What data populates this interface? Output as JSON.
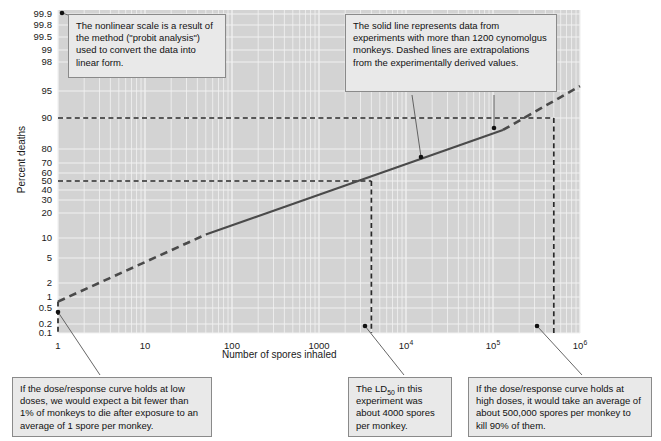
{
  "chart_data": {
    "type": "line",
    "title": "",
    "xlabel": "Number of spores inhaled",
    "ylabel": "Percent deaths",
    "x_scale": "log10",
    "y_scale": "probit",
    "xlim": [
      1,
      1000000
    ],
    "ylim": [
      0.1,
      99.9
    ],
    "grid": true,
    "legend": "none",
    "x_ticks": [
      {
        "value": 1,
        "label": "1",
        "sup": ""
      },
      {
        "value": 10,
        "label": "10",
        "sup": ""
      },
      {
        "value": 100,
        "label": "100",
        "sup": ""
      },
      {
        "value": 1000,
        "label": "1000",
        "sup": ""
      },
      {
        "value": 10000,
        "label": "10",
        "sup": "4"
      },
      {
        "value": 100000,
        "label": "10",
        "sup": "5"
      },
      {
        "value": 1000000,
        "label": "10",
        "sup": "6"
      }
    ],
    "y_ticks": [
      99.9,
      99.8,
      99.5,
      99,
      98,
      95,
      90,
      80,
      70,
      60,
      50,
      40,
      30,
      20,
      10,
      5,
      2,
      1,
      0.5,
      0.2,
      0.1
    ],
    "series": [
      {
        "name": "dose-response (extrapolated, low dose)",
        "style": "dashed",
        "points": [
          [
            1,
            0.75
          ],
          [
            50,
            11
          ]
        ]
      },
      {
        "name": "dose-response (experimental)",
        "style": "solid",
        "points": [
          [
            50,
            11
          ],
          [
            130000,
            86
          ]
        ]
      },
      {
        "name": "dose-response (extrapolated, high dose)",
        "style": "dashed",
        "points": [
          [
            130000,
            86
          ],
          [
            1000000,
            95.5
          ]
        ]
      }
    ],
    "reference_lines": [
      {
        "name": "ld50-horizontal",
        "orientation": "horizontal",
        "value": 50,
        "style": "dashed"
      },
      {
        "name": "ld90-horizontal",
        "orientation": "horizontal",
        "value": 90,
        "style": "dashed"
      },
      {
        "name": "ld50-vertical",
        "orientation": "vertical",
        "value": 4000,
        "style": "dashed"
      },
      {
        "name": "ld90-vertical",
        "orientation": "vertical",
        "value": 500000,
        "style": "dashed"
      },
      {
        "name": "one-spore-vertical",
        "orientation": "vertical",
        "value": 1,
        "style": "dashed"
      }
    ],
    "annotations": [
      {
        "id": "probit-note",
        "text": "The nonlinear scale is a result of the method (\"probit analysis\") used to convert the data into linear form.",
        "anchor": {
          "x": 1,
          "y": 99.9
        }
      },
      {
        "id": "solid-line-note",
        "text": "The solid line represents data from experiments with more than 1200 cynomolgus monkeys. Dashed lines are extrapolations from the experimentally derived values.",
        "anchor_solid": {
          "x": 30000,
          "y": 76
        },
        "anchor_dashed": {
          "x": 200000,
          "y": 88
        }
      },
      {
        "id": "low-dose-note",
        "text": "If the dose/response curve holds at low doses, we would expect a bit fewer than 1% of monkeys to die after exposure to an average of 1 spore per monkey.",
        "anchor": {
          "x": 1,
          "y": 0.35
        }
      },
      {
        "id": "ld50-note",
        "text_pre": "The LD",
        "text_sub": "50",
        "text_post": " in this experiment was about 4000 spores per monkey.",
        "anchor": {
          "x": 4000,
          "y": 0.32
        }
      },
      {
        "id": "high-dose-note",
        "text": "If the dose/response curve holds at high doses, it would take an average of about 500,000 spores per monkey to kill 90% of them.",
        "anchor": {
          "x": 500000,
          "y": 0.32
        }
      }
    ],
    "colors": {
      "plot_background": "#d3d3d3",
      "gridline": "#f2f2f2",
      "line": "#4a4a4a",
      "callout_background": "#e9e9e9",
      "callout_border": "#8a8a8a",
      "text": "#111111"
    }
  }
}
